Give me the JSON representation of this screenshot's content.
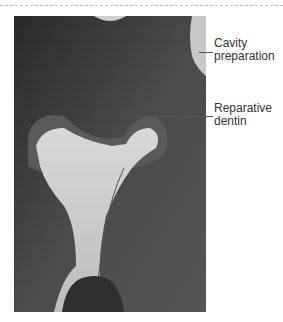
{
  "figure": {
    "labels": [
      {
        "id": "cavity",
        "text_line1": "Cavity",
        "text_line2": "preparation"
      },
      {
        "id": "reparative",
        "text_line1": "Reparative",
        "text_line2": "dentin"
      }
    ]
  }
}
